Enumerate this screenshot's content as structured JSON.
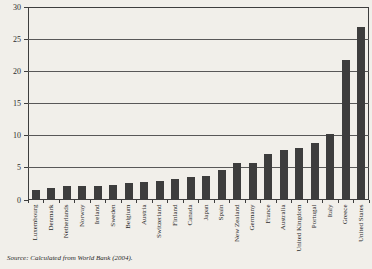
{
  "figure": {
    "source_note": "Source: Calculated from World Bank (2004)."
  },
  "chart_data": {
    "type": "bar",
    "title": "",
    "xlabel": "",
    "ylabel": "",
    "categories": [
      "Luxembourg",
      "Denmark",
      "Netherlands",
      "Norway",
      "Ireland",
      "Sweden",
      "Belgium",
      "Austria",
      "Switzerland",
      "Finland",
      "Canada",
      "Japan",
      "Spain",
      "New Zealand",
      "Germany",
      "France",
      "Australia",
      "United Kingdom",
      "Portugal",
      "Italy",
      "Greece",
      "United States"
    ],
    "values": [
      1.6,
      1.9,
      2.2,
      2.2,
      2.2,
      2.3,
      2.6,
      2.8,
      2.9,
      3.3,
      3.5,
      3.8,
      4.7,
      5.7,
      5.8,
      7.2,
      7.8,
      8.1,
      8.8,
      10.3,
      21.8,
      26.9
    ],
    "ylim": [
      0,
      30
    ],
    "yticks": [
      0,
      5,
      10,
      15,
      20,
      25,
      30
    ],
    "grid": true,
    "legend": "none",
    "bar_color": "#3d3d3d",
    "background_color": "#f1efea"
  }
}
